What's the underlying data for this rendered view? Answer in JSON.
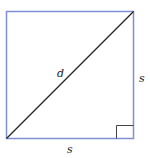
{
  "diagram": {
    "labels": {
      "diagonal": "d",
      "right_side": "s",
      "bottom_side": "s"
    },
    "colors": {
      "square_stroke": "#7f8fd6",
      "diagonal_stroke": "#222222",
      "right_angle_marker": "#444444"
    }
  }
}
